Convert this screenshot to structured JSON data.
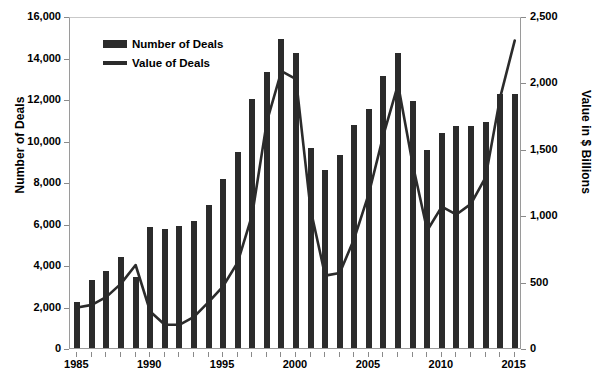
{
  "chart_data": {
    "type": "bar",
    "title": "",
    "xlabel": "",
    "ylabel": "Number of Deals",
    "y2label": "Value in $ Billions",
    "ylim": [
      0,
      16000
    ],
    "y2lim": [
      0,
      2500
    ],
    "xlim": [
      1985,
      2015
    ],
    "grid": false,
    "legend_position": "top-left",
    "yticks": [
      "0",
      "2,000",
      "4,000",
      "6,000",
      "8,000",
      "10,000",
      "12,000",
      "14,000",
      "16,000"
    ],
    "ytick_values": [
      0,
      2000,
      4000,
      6000,
      8000,
      10000,
      12000,
      14000,
      16000
    ],
    "y2ticks": [
      "0",
      "500",
      "1,000",
      "1,500",
      "2,000",
      "2,500"
    ],
    "y2tick_values": [
      0,
      500,
      1000,
      1500,
      2000,
      2500
    ],
    "xticks": [
      "1985",
      "1990",
      "1995",
      "2000",
      "2005",
      "2010",
      "2015"
    ],
    "categories": [
      1985,
      1986,
      1987,
      1988,
      1989,
      1990,
      1991,
      1992,
      1993,
      1994,
      1995,
      1996,
      1997,
      1998,
      1999,
      2000,
      2001,
      2002,
      2003,
      2004,
      2005,
      2006,
      2007,
      2008,
      2009,
      2010,
      2011,
      2012,
      2013,
      2014,
      2015
    ],
    "series": [
      {
        "name": "Number of Deals",
        "axis": "left",
        "type": "bar",
        "color": "#2b2b2b",
        "values": [
          2200,
          3300,
          3700,
          4400,
          3400,
          5850,
          5750,
          5900,
          6100,
          6900,
          8150,
          9450,
          12000,
          13300,
          14900,
          14200,
          9650,
          8600,
          9300,
          10750,
          11500,
          13100,
          14200,
          11900,
          9550,
          10350,
          10700,
          10700,
          10900,
          12250,
          12250
        ]
      },
      {
        "name": "Value of Deals",
        "axis": "right",
        "type": "line",
        "color": "#2b2b2b",
        "values": [
          320,
          340,
          400,
          500,
          640,
          290,
          190,
          190,
          250,
          360,
          480,
          660,
          1020,
          1720,
          2100,
          2040,
          1060,
          560,
          580,
          840,
          1180,
          1620,
          2000,
          1400,
          900,
          1080,
          1020,
          1100,
          1300,
          1900,
          2330
        ]
      }
    ]
  },
  "legend": {
    "bar_label": "Number of Deals",
    "line_label": "Value of Deals"
  },
  "axes": {
    "left_title": "Number of Deals",
    "right_title": "Value in $ Billions"
  }
}
